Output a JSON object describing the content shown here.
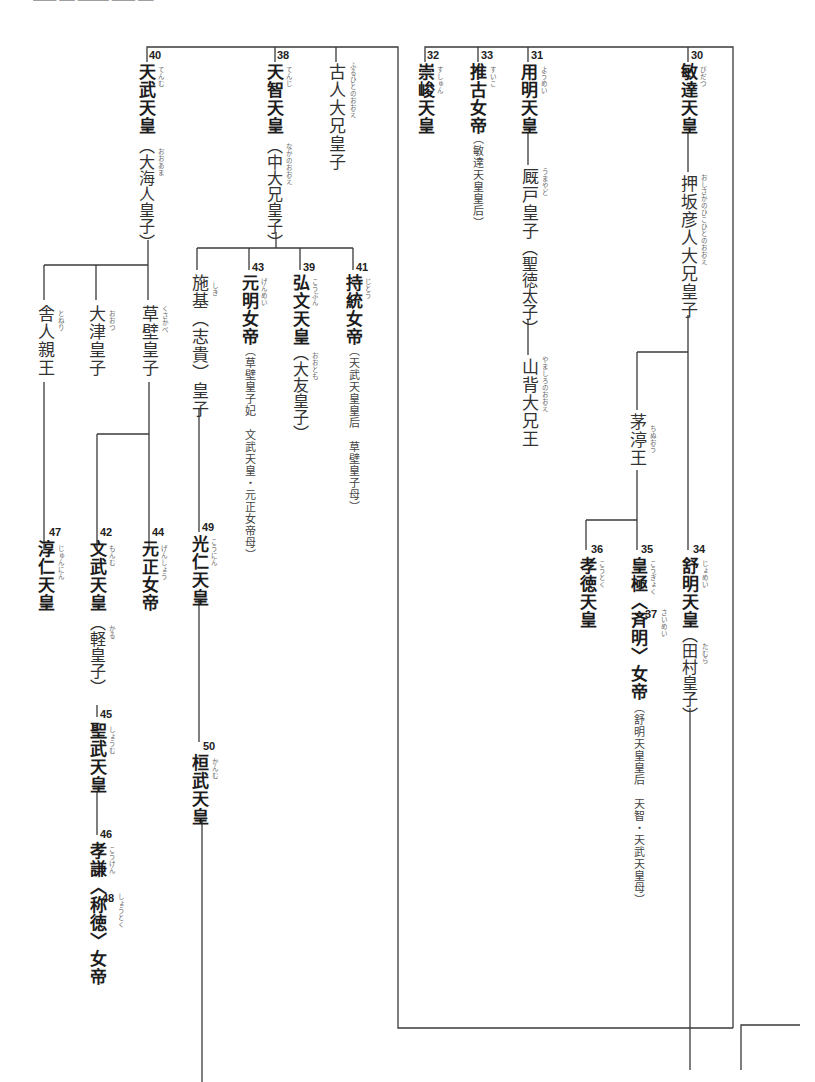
{
  "diagram": {
    "type": "family-tree",
    "orientation": "vertical-rl"
  },
  "nodes": {
    "n40": {
      "num": "40",
      "name": "天武天皇",
      "ruby": "てんむ",
      "alt": "（大海人皇子）",
      "alt_ruby": "おおあま"
    },
    "n38": {
      "num": "38",
      "name": "天智天皇",
      "ruby": "てんじ",
      "alt": "（中大兄皇子）",
      "alt_ruby": "なかのおおえ"
    },
    "furuhito": {
      "name": "古人大兄皇子",
      "ruby": "ふるひとのおおえ"
    },
    "n32": {
      "num": "32",
      "name": "崇峻天皇",
      "ruby": "すしゅん"
    },
    "n33": {
      "num": "33",
      "name": "推古女帝",
      "ruby": "すいこ",
      "note": "（敏達天皇皇后）"
    },
    "n31": {
      "num": "31",
      "name": "用明天皇",
      "ruby": "ようめい"
    },
    "umayado": {
      "name": "厩戸皇子",
      "ruby": "うまやど",
      "alt": "（聖徳太子）"
    },
    "yamashiro": {
      "name": "山背大兄王",
      "ruby": "やましろのおおえ"
    },
    "n30": {
      "num": "30",
      "name": "敏達天皇",
      "ruby": "びだつ"
    },
    "oshisaka": {
      "name": "押坂彦人大兄皇子",
      "ruby": "おしさかのひこひとのおおえ"
    },
    "toneri": {
      "name": "舎人親王",
      "ruby": "とねり"
    },
    "otsu": {
      "name": "大津皇子",
      "ruby": "おおつ"
    },
    "kusakabe": {
      "name": "草壁皇子",
      "ruby": "くさかべ"
    },
    "shiki": {
      "name": "施基（志貴）皇子",
      "ruby": "しき"
    },
    "n43": {
      "num": "43",
      "name": "元明女帝",
      "ruby": "げんめい",
      "note": "（草壁皇子妃　文武天皇・元正女帝母）"
    },
    "n39": {
      "num": "39",
      "name": "弘文天皇",
      "ruby": "こうぶん",
      "alt": "（大友皇子）",
      "alt_ruby": "おおとも"
    },
    "n41": {
      "num": "41",
      "name": "持統女帝",
      "ruby": "じとう",
      "note": "（天武天皇皇后　草壁皇子母）"
    },
    "chinu": {
      "name": "茅渟王",
      "ruby": "ちぬおう"
    },
    "n47": {
      "num": "47",
      "name": "淳仁天皇",
      "ruby": "じゅんにん"
    },
    "n42": {
      "num": "42",
      "name": "文武天皇",
      "ruby": "もんむ",
      "alt": "（軽皇子）",
      "alt_ruby": "かる"
    },
    "n44": {
      "num": "44",
      "name": "元正女帝",
      "ruby": "げんしょう"
    },
    "n49": {
      "num": "49",
      "name": "光仁天皇",
      "ruby": "こうにん"
    },
    "n36": {
      "num": "36",
      "name": "孝徳天皇",
      "ruby": "こうとく"
    },
    "n35": {
      "num": "35",
      "name": "皇極",
      "ruby": "こうぎょく",
      "num2": "37",
      "name2": "〈斉明〉女帝",
      "ruby2": "さいめい",
      "note": "（舒明天皇皇后　天智・天武天皇母）"
    },
    "n34": {
      "num": "34",
      "name": "舒明天皇",
      "ruby": "じょめい",
      "alt": "（田村皇子）",
      "alt_ruby": "たむら"
    },
    "n45": {
      "num": "45",
      "name": "聖武天皇",
      "ruby": "しょうむ"
    },
    "n50": {
      "num": "50",
      "name": "桓武天皇",
      "ruby": "かんむ"
    },
    "n46": {
      "num": "46",
      "name": "孝謙",
      "ruby": "こうけん",
      "num2": "48",
      "name2": "〈称徳〉女帝",
      "ruby2": "しょうとく"
    }
  },
  "colors": {
    "line": "#3a3a3a",
    "text": "#222222",
    "ruby": "#666666",
    "background": "#ffffff"
  }
}
